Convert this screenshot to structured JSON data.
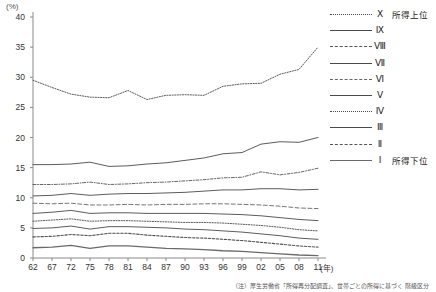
{
  "chart_data": {
    "type": "line",
    "title": "",
    "xlabel": "(年)",
    "ylabel": "(%)",
    "ylim": [
      0,
      40
    ],
    "ytick_step": 5,
    "yticks": [
      "0",
      "5",
      "10",
      "15",
      "20",
      "25",
      "30",
      "35",
      "40"
    ],
    "grid": false,
    "legend_position": "right",
    "categories": [
      "62",
      "67",
      "72",
      "75",
      "78",
      "81",
      "84",
      "87",
      "90",
      "93",
      "96",
      "99",
      "02",
      "05",
      "08",
      "11"
    ],
    "series": [
      {
        "name": "Ⅹ",
        "note": "所得上位",
        "style": "dotted",
        "values": [
          29.5,
          28.3,
          27.2,
          26.7,
          26.6,
          27.8,
          26.3,
          27.0,
          27.1,
          27.0,
          28.5,
          28.9,
          29.0,
          30.5,
          31.3,
          35.0
        ]
      },
      {
        "name": "Ⅸ",
        "note": "",
        "style": "solid",
        "values": [
          15.5,
          15.5,
          15.6,
          15.9,
          15.2,
          15.3,
          15.6,
          15.8,
          16.2,
          16.6,
          17.3,
          17.5,
          18.9,
          19.3,
          19.2,
          20.0
        ]
      },
      {
        "name": "Ⅷ",
        "note": "",
        "style": "dashdot",
        "values": [
          12.2,
          12.2,
          12.3,
          12.6,
          12.2,
          12.3,
          12.5,
          12.6,
          12.8,
          13.0,
          13.3,
          13.4,
          14.3,
          13.8,
          14.2,
          14.9
        ]
      },
      {
        "name": "Ⅶ",
        "note": "",
        "style": "solid",
        "values": [
          10.3,
          10.4,
          10.7,
          10.4,
          10.6,
          10.7,
          10.7,
          10.8,
          10.9,
          11.1,
          11.3,
          11.3,
          11.5,
          11.5,
          11.3,
          11.4
        ]
      },
      {
        "name": "Ⅵ",
        "note": "",
        "style": "longdash",
        "values": [
          9.1,
          9.0,
          9.1,
          8.8,
          8.8,
          8.9,
          8.8,
          8.9,
          8.9,
          9.0,
          9.0,
          8.9,
          8.8,
          8.6,
          8.3,
          8.2
        ]
      },
      {
        "name": "Ⅴ",
        "note": "",
        "style": "solid",
        "values": [
          7.4,
          7.6,
          7.9,
          7.4,
          7.5,
          7.5,
          7.4,
          7.4,
          7.4,
          7.4,
          7.3,
          7.2,
          7.0,
          6.7,
          6.4,
          6.2
        ]
      },
      {
        "name": "Ⅳ",
        "note": "",
        "style": "dotted",
        "values": [
          6.1,
          6.3,
          6.5,
          6.1,
          6.2,
          6.2,
          6.1,
          6.0,
          5.9,
          5.9,
          5.8,
          5.6,
          5.4,
          5.1,
          4.7,
          4.5
        ]
      },
      {
        "name": "Ⅲ",
        "note": "",
        "style": "solid",
        "values": [
          4.9,
          5.0,
          5.3,
          4.8,
          5.2,
          5.2,
          5.1,
          5.0,
          4.8,
          4.7,
          4.5,
          4.3,
          4.0,
          3.7,
          3.3,
          3.1
        ]
      },
      {
        "name": "Ⅱ",
        "note": "",
        "style": "dashed",
        "values": [
          3.5,
          3.6,
          3.9,
          3.7,
          4.1,
          4.1,
          3.8,
          3.6,
          3.4,
          3.3,
          3.1,
          2.9,
          2.6,
          2.3,
          2.0,
          1.8
        ]
      },
      {
        "name": "Ⅰ",
        "note": "所得下位",
        "style": "solid-thick",
        "values": [
          1.7,
          1.8,
          2.1,
          1.6,
          2.0,
          2.0,
          1.8,
          1.6,
          1.5,
          1.4,
          1.2,
          1.1,
          0.9,
          0.7,
          0.5,
          0.4
        ]
      }
    ],
    "footnote": "（注）厚生労働省「所得再分配調査」、世帯ごとの所得に基づく 階級区分"
  }
}
